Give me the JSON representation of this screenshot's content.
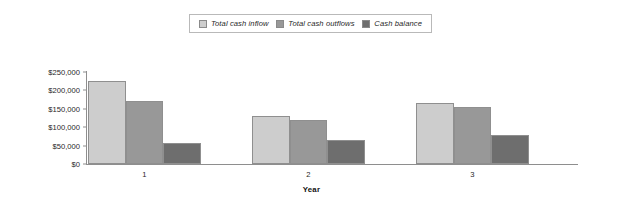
{
  "chart_data": {
    "type": "bar",
    "title": "",
    "xlabel": "Year",
    "ylabel": "",
    "categories": [
      "1",
      "2",
      "3"
    ],
    "series": [
      {
        "name": "Total cash inflow",
        "values": [
          225000,
          130000,
          165000
        ],
        "color": "#cdcdcd"
      },
      {
        "name": "Total cash outflows",
        "values": [
          170000,
          120000,
          155000
        ],
        "color": "#989898"
      },
      {
        "name": "Cash balance",
        "values": [
          57000,
          65000,
          80000
        ],
        "color": "#6e6e6e"
      }
    ],
    "ylim": [
      0,
      250000
    ],
    "yticks": [
      0,
      50000,
      100000,
      150000,
      200000,
      250000
    ],
    "ytick_labels": [
      "$0",
      "$50,000",
      "$100,000",
      "$150,000",
      "$200,000",
      "$250,000"
    ],
    "grid": false,
    "legend_position": "top-center"
  },
  "legend": {
    "entries": [
      {
        "label": "Total cash inflow",
        "swatch": "legend-swatch-total-cash-inflow"
      },
      {
        "label": "Total cash outflows",
        "swatch": "legend-swatch-total-cash-outflows"
      },
      {
        "label": "Cash balance",
        "swatch": "legend-swatch-cash-balance"
      }
    ]
  },
  "axes": {
    "x_title": "Year",
    "x_tick_labels": [
      "1",
      "2",
      "3"
    ],
    "y_tick_labels": [
      "$250,000",
      "$200,000",
      "$150,000",
      "$100,000",
      "$50,000",
      "$0"
    ]
  }
}
